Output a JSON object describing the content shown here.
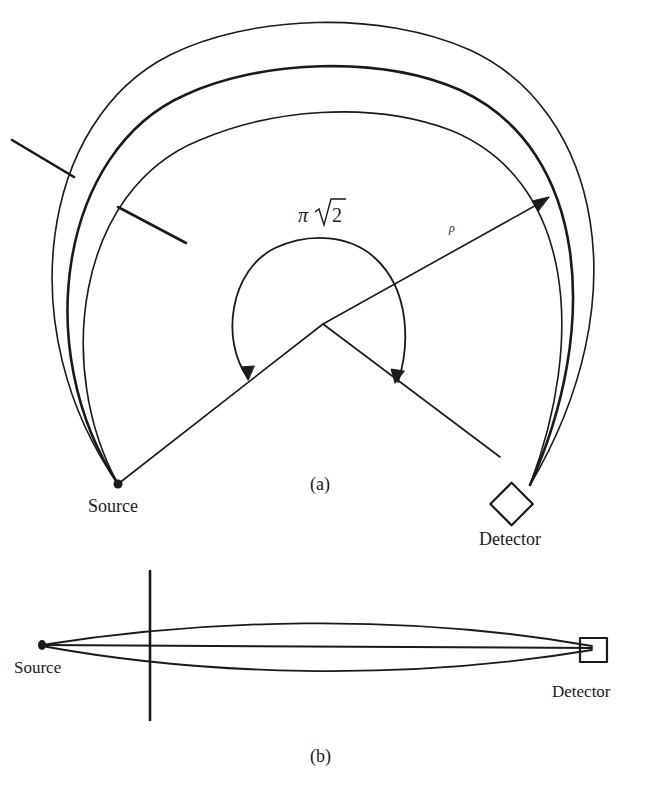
{
  "figure_a": {
    "caption": "(a)",
    "angle_label_pi": "π",
    "angle_label_root": "2",
    "radius_label": "ρ",
    "source_label": "Source",
    "detector_label": "Detector"
  },
  "figure_b": {
    "caption": "(b)",
    "source_label": "Source",
    "detector_label": "Detector"
  },
  "colors": {
    "ink": "#1a1a1a",
    "background": "#ffffff"
  }
}
